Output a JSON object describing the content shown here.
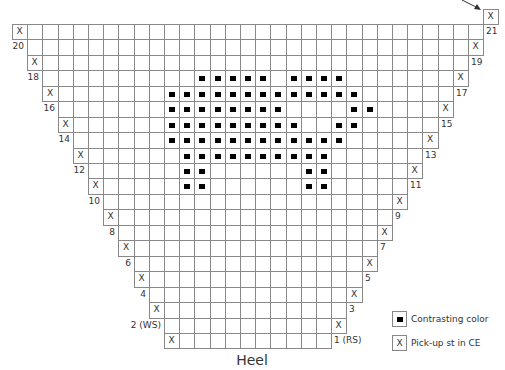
{
  "chart_data": {
    "type": "table",
    "title": "Heel",
    "grid": {
      "origin_x": 12,
      "origin_y": 8.5,
      "cell_w": 15.2,
      "cell_h": 15.45,
      "columns": 32
    },
    "rows": [
      {
        "row": 1,
        "label": "1 (RS)",
        "side": "right",
        "left": 10,
        "right": 20,
        "x_col": 10
      },
      {
        "row": 2,
        "label": "2 (WS)",
        "side": "left",
        "left": 10,
        "right": 21,
        "x_col": 21
      },
      {
        "row": 3,
        "label": "3",
        "side": "right",
        "left": 9,
        "right": 21,
        "x_col": 9
      },
      {
        "row": 4,
        "label": "4",
        "side": "left",
        "left": 9,
        "right": 22,
        "x_col": 22
      },
      {
        "row": 5,
        "label": "5",
        "side": "right",
        "left": 8,
        "right": 22,
        "x_col": 8
      },
      {
        "row": 6,
        "label": "6",
        "side": "left",
        "left": 8,
        "right": 23,
        "x_col": 23
      },
      {
        "row": 7,
        "label": "7",
        "side": "right",
        "left": 7,
        "right": 23,
        "x_col": 7
      },
      {
        "row": 8,
        "label": "8",
        "side": "left",
        "left": 7,
        "right": 24,
        "x_col": 24
      },
      {
        "row": 9,
        "label": "9",
        "side": "right",
        "left": 6,
        "right": 24,
        "x_col": 6
      },
      {
        "row": 10,
        "label": "10",
        "side": "left",
        "left": 6,
        "right": 25,
        "x_col": 25
      },
      {
        "row": 11,
        "label": "11",
        "side": "right",
        "left": 5,
        "right": 25,
        "x_col": 5
      },
      {
        "row": 12,
        "label": "12",
        "side": "left",
        "left": 5,
        "right": 26,
        "x_col": 26
      },
      {
        "row": 13,
        "label": "13",
        "side": "right",
        "left": 4,
        "right": 26,
        "x_col": 4
      },
      {
        "row": 14,
        "label": "14",
        "side": "left",
        "left": 4,
        "right": 27,
        "x_col": 27
      },
      {
        "row": 15,
        "label": "15",
        "side": "right",
        "left": 3,
        "right": 27,
        "x_col": 3
      },
      {
        "row": 16,
        "label": "16",
        "side": "left",
        "left": 3,
        "right": 28,
        "x_col": 28
      },
      {
        "row": 17,
        "label": "17",
        "side": "right",
        "left": 2,
        "right": 28,
        "x_col": 2
      },
      {
        "row": 18,
        "label": "18",
        "side": "left",
        "left": 2,
        "right": 29,
        "x_col": 29
      },
      {
        "row": 19,
        "label": "19",
        "side": "right",
        "left": 1,
        "right": 29,
        "x_col": 1
      },
      {
        "row": 20,
        "label": "20",
        "side": "left",
        "left": 1,
        "right": 30,
        "x_col": 30
      },
      {
        "row": 21,
        "label": "21",
        "side": "right",
        "left": 0,
        "right": 30,
        "x_col": 0
      }
    ],
    "extra_cell": {
      "band": 0,
      "col": 31,
      "mark": "X",
      "arrow": true
    },
    "contrasting_color": {
      "11": [
        11,
        12,
        19,
        20
      ],
      "12": [
        11,
        12,
        19,
        20
      ],
      "13": [
        11,
        12,
        13,
        14,
        15,
        16,
        17,
        18,
        19,
        20
      ],
      "14": [
        10,
        11,
        12,
        13,
        14,
        15,
        16,
        17,
        18,
        19,
        20,
        21
      ],
      "15": [
        10,
        11,
        12,
        13,
        14,
        15,
        16,
        17,
        18,
        21,
        22
      ],
      "16": [
        10,
        11,
        12,
        13,
        14,
        15,
        16,
        17,
        22,
        23
      ],
      "17": [
        10,
        11,
        12,
        13,
        14,
        15,
        16,
        17,
        18,
        19,
        20,
        21,
        22
      ],
      "18": [
        12,
        13,
        14,
        15,
        16,
        18,
        19,
        20,
        21
      ]
    },
    "legend": [
      {
        "symbol": "filled-square",
        "label": "Contrasting color"
      },
      {
        "symbol": "X",
        "label": "Pick-up st in CE"
      }
    ]
  },
  "symbols": {
    "pickup": "X"
  },
  "legend": {
    "contrasting": "Contrasting color",
    "pickup": "Pick-up st in CE",
    "pickup_symbol": "X"
  },
  "caption": "Heel",
  "colors": {
    "grid_line": "#888888",
    "ink": "#000000",
    "text": "#333333"
  }
}
